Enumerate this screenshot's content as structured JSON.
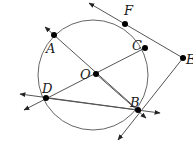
{
  "diagram": {
    "type": "circle-geometry",
    "circle": {
      "center_label": "O",
      "cx": 93,
      "cy": 75,
      "r": 55
    },
    "points": [
      {
        "id": "A",
        "label": "A",
        "x": 54,
        "y": 35,
        "lx": 46,
        "ly": 53
      },
      {
        "id": "F",
        "label": "F",
        "x": 125,
        "y": 24,
        "lx": 124,
        "ly": 15
      },
      {
        "id": "C",
        "label": "C",
        "x": 145,
        "y": 48,
        "lx": 132,
        "ly": 50
      },
      {
        "id": "E",
        "label": "E",
        "x": 183,
        "y": 58,
        "lx": 186,
        "ly": 64
      },
      {
        "id": "O",
        "label": "O",
        "x": 96,
        "y": 74,
        "lx": 80,
        "ly": 79
      },
      {
        "id": "D",
        "label": "D",
        "x": 46,
        "y": 98,
        "lx": 42,
        "ly": 93
      },
      {
        "id": "B",
        "label": "B",
        "x": 138,
        "y": 110,
        "lx": 130,
        "ly": 107
      }
    ],
    "segments": [
      {
        "from": "A",
        "to": "B",
        "note": "diameter through O, extended both ways"
      },
      {
        "from": "D",
        "to": "C",
        "note": "through O, extended past D"
      },
      {
        "from": "D",
        "to": "B",
        "note": "chord extended both ways"
      },
      {
        "from": "F",
        "to": "E",
        "note": "tangent at F extended past F"
      },
      {
        "from": "E",
        "to": "B",
        "note": "tangent at B extended past B"
      }
    ],
    "colors": {
      "line": "#555555",
      "point": "#000000",
      "label": "#1a1a1a"
    }
  }
}
